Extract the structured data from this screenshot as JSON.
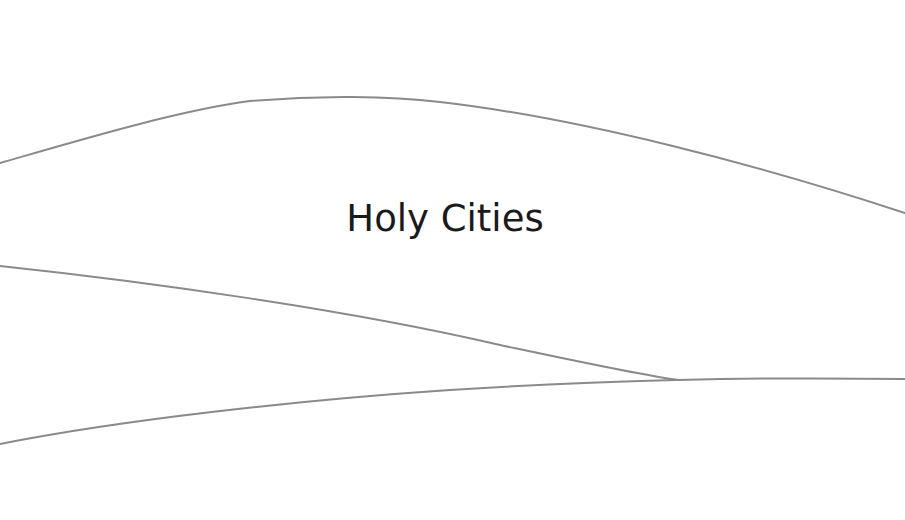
{
  "slide": {
    "title": "Holy Cities",
    "colors": {
      "background": "#ffffff",
      "title_text": "#1a1a1a",
      "line_stroke": "#8a8a8a"
    }
  },
  "decor": {
    "lines": [
      {
        "name": "top-arc",
        "d": "M 0 163 C 80 140, 180 110, 250 101 C 320 95, 390 96, 440 102 C 580 118, 760 165, 905 213"
      },
      {
        "name": "middle-descending",
        "d": "M 0 266 C 150 282, 350 310, 500 345 C 580 362, 640 375, 678 380"
      },
      {
        "name": "bottom-ascending",
        "d": "M 0 444 C 120 420, 300 400, 450 390 C 560 383, 640 381, 678 380 C 760 378, 830 378, 905 379"
      }
    ]
  }
}
